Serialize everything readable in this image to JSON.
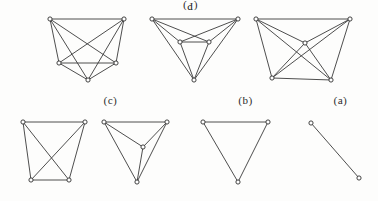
{
  "figure": {
    "background_color": "#fdfdfc",
    "edge_color": "#3a3a3a",
    "vertex_fill": "#ffffff",
    "vertex_stroke": "#2e2e2e",
    "width": 378,
    "height": 201
  },
  "captions": {
    "top": "(P)",
    "bottom_left": "(ɔ)",
    "bottom_mid": "(q)",
    "bottom_right": "(ɐ)"
  },
  "graphs": [
    {
      "id": "graph-k5-trapezoid",
      "label": "K5 trapezoid layout",
      "vertex_count": 5,
      "edge_count": 10,
      "vertices": [
        {
          "id": "v1",
          "x": 50,
          "y": 19
        },
        {
          "id": "v2",
          "x": 124,
          "y": 19
        },
        {
          "id": "v3",
          "x": 59,
          "y": 63
        },
        {
          "id": "v4",
          "x": 116,
          "y": 63
        },
        {
          "id": "v5",
          "x": 88,
          "y": 80
        }
      ],
      "edges": [
        [
          "v1",
          "v2"
        ],
        [
          "v1",
          "v3"
        ],
        [
          "v1",
          "v4"
        ],
        [
          "v1",
          "v5"
        ],
        [
          "v2",
          "v3"
        ],
        [
          "v2",
          "v4"
        ],
        [
          "v2",
          "v5"
        ],
        [
          "v3",
          "v4"
        ],
        [
          "v3",
          "v5"
        ],
        [
          "v4",
          "v5"
        ]
      ]
    },
    {
      "id": "graph-k5-planarish",
      "label": "five vertex graph, inner pair layout",
      "vertex_count": 5,
      "edge_count": 9,
      "vertices": [
        {
          "id": "w1",
          "x": 152,
          "y": 19
        },
        {
          "id": "w2",
          "x": 238,
          "y": 19
        },
        {
          "id": "w3",
          "x": 180,
          "y": 42
        },
        {
          "id": "w4",
          "x": 209,
          "y": 42
        },
        {
          "id": "w5",
          "x": 194,
          "y": 80
        }
      ],
      "edges": [
        [
          "w1",
          "w2"
        ],
        [
          "w1",
          "w3"
        ],
        [
          "w1",
          "w4"
        ],
        [
          "w1",
          "w5"
        ],
        [
          "w2",
          "w3"
        ],
        [
          "w2",
          "w4"
        ],
        [
          "w2",
          "w5"
        ],
        [
          "w3",
          "w4"
        ],
        [
          "w3",
          "w5"
        ],
        [
          "w4",
          "w5"
        ]
      ]
    },
    {
      "id": "graph-k5-centered",
      "label": "K5 with central vertex",
      "vertex_count": 5,
      "edge_count": 10,
      "vertices": [
        {
          "id": "u1",
          "x": 256,
          "y": 19
        },
        {
          "id": "u2",
          "x": 350,
          "y": 19
        },
        {
          "id": "u3",
          "x": 305,
          "y": 43
        },
        {
          "id": "u4",
          "x": 272,
          "y": 78
        },
        {
          "id": "u5",
          "x": 331,
          "y": 80
        }
      ],
      "edges": [
        [
          "u1",
          "u2"
        ],
        [
          "u1",
          "u3"
        ],
        [
          "u1",
          "u4"
        ],
        [
          "u1",
          "u5"
        ],
        [
          "u2",
          "u3"
        ],
        [
          "u2",
          "u4"
        ],
        [
          "u2",
          "u5"
        ],
        [
          "u3",
          "u4"
        ],
        [
          "u3",
          "u5"
        ],
        [
          "u4",
          "u5"
        ]
      ]
    },
    {
      "id": "graph-k4-trapezoid",
      "label": "K4 trapezoid with crossing diagonals",
      "vertex_count": 4,
      "edge_count": 6,
      "vertices": [
        {
          "id": "a1",
          "x": 23,
          "y": 122
        },
        {
          "id": "a2",
          "x": 85,
          "y": 122
        },
        {
          "id": "a3",
          "x": 31,
          "y": 180
        },
        {
          "id": "a4",
          "x": 69,
          "y": 180
        }
      ],
      "edges": [
        [
          "a1",
          "a2"
        ],
        [
          "a1",
          "a3"
        ],
        [
          "a1",
          "a4"
        ],
        [
          "a2",
          "a3"
        ],
        [
          "a2",
          "a4"
        ],
        [
          "a3",
          "a4"
        ]
      ]
    },
    {
      "id": "graph-k4-planar",
      "label": "K4 planar with central vertex",
      "vertex_count": 4,
      "edge_count": 6,
      "vertices": [
        {
          "id": "b1",
          "x": 104,
          "y": 122
        },
        {
          "id": "b2",
          "x": 167,
          "y": 122
        },
        {
          "id": "b3",
          "x": 143,
          "y": 147
        },
        {
          "id": "b4",
          "x": 137,
          "y": 182
        }
      ],
      "edges": [
        [
          "b1",
          "b2"
        ],
        [
          "b1",
          "b3"
        ],
        [
          "b1",
          "b4"
        ],
        [
          "b2",
          "b3"
        ],
        [
          "b2",
          "b4"
        ],
        [
          "b3",
          "b4"
        ]
      ]
    },
    {
      "id": "graph-k3-triangle",
      "label": "K3 triangle",
      "vertex_count": 3,
      "edge_count": 3,
      "vertices": [
        {
          "id": "c1",
          "x": 203,
          "y": 122
        },
        {
          "id": "c2",
          "x": 268,
          "y": 122
        },
        {
          "id": "c3",
          "x": 238,
          "y": 182
        }
      ],
      "edges": [
        [
          "c1",
          "c2"
        ],
        [
          "c1",
          "c3"
        ],
        [
          "c2",
          "c3"
        ]
      ]
    },
    {
      "id": "graph-k2-edge",
      "label": "K2 single edge",
      "vertex_count": 2,
      "edge_count": 1,
      "vertices": [
        {
          "id": "d1",
          "x": 311,
          "y": 123
        },
        {
          "id": "d2",
          "x": 359,
          "y": 178
        }
      ],
      "edges": [
        [
          "d1",
          "d2"
        ]
      ]
    }
  ]
}
